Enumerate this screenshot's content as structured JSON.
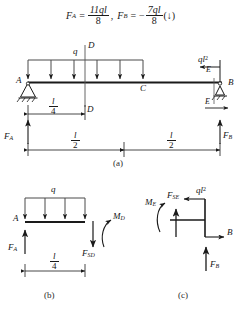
{
  "figure": {
    "kind": "beam-free-body-diagram",
    "stroke_color": "#1a1a1a",
    "text_color": "#141414"
  },
  "equation": {
    "fa_symbol": "F",
    "fa_sub": "A",
    "equals": "=",
    "fa_numerator": "11ql",
    "fa_denominator": "8",
    "separator": ",",
    "fb_symbol": "F",
    "fb_sub": "B",
    "fb_equals": "=",
    "fb_minus": "−",
    "fb_numerator": "7ql",
    "fb_denominator": "8",
    "fb_direction": "(↓)"
  },
  "diagram_a": {
    "caption": "(a)",
    "point_a": "A",
    "point_b": "B",
    "point_c": "C",
    "point_d_top": "D",
    "point_d_bottom": "D",
    "point_e_top": "E",
    "point_e_bottom": "E",
    "load_q": "q",
    "moment_ql2_base": "ql",
    "moment_ql2_exp": "2",
    "reaction_fa": "F",
    "reaction_fa_sub": "A",
    "reaction_fb": "F",
    "reaction_fb_sub": "B",
    "dim_quarter_num": "l",
    "dim_quarter_den": "4",
    "dim_half_left_num": "l",
    "dim_half_left_den": "2",
    "dim_half_right_num": "l",
    "dim_half_right_den": "2",
    "distributed_arrow_count": 6
  },
  "diagram_b": {
    "caption": "(b)",
    "point_a": "A",
    "load_q": "q",
    "reaction_fa": "F",
    "reaction_fa_sub": "A",
    "shear_fsd": "F",
    "shear_fsd_sub": "SD",
    "moment_md": "M",
    "moment_md_sub": "D",
    "dim_num": "l",
    "dim_den": "4",
    "distributed_arrow_count": 4
  },
  "diagram_c": {
    "caption": "(c)",
    "point_b": "B",
    "moment_me": "M",
    "moment_me_sub": "E",
    "shear_fse": "F",
    "shear_fse_sub": "SE",
    "applied_ql2_base": "ql",
    "applied_ql2_exp": "2",
    "reaction_fb": "F",
    "reaction_fb_sub": "B"
  }
}
